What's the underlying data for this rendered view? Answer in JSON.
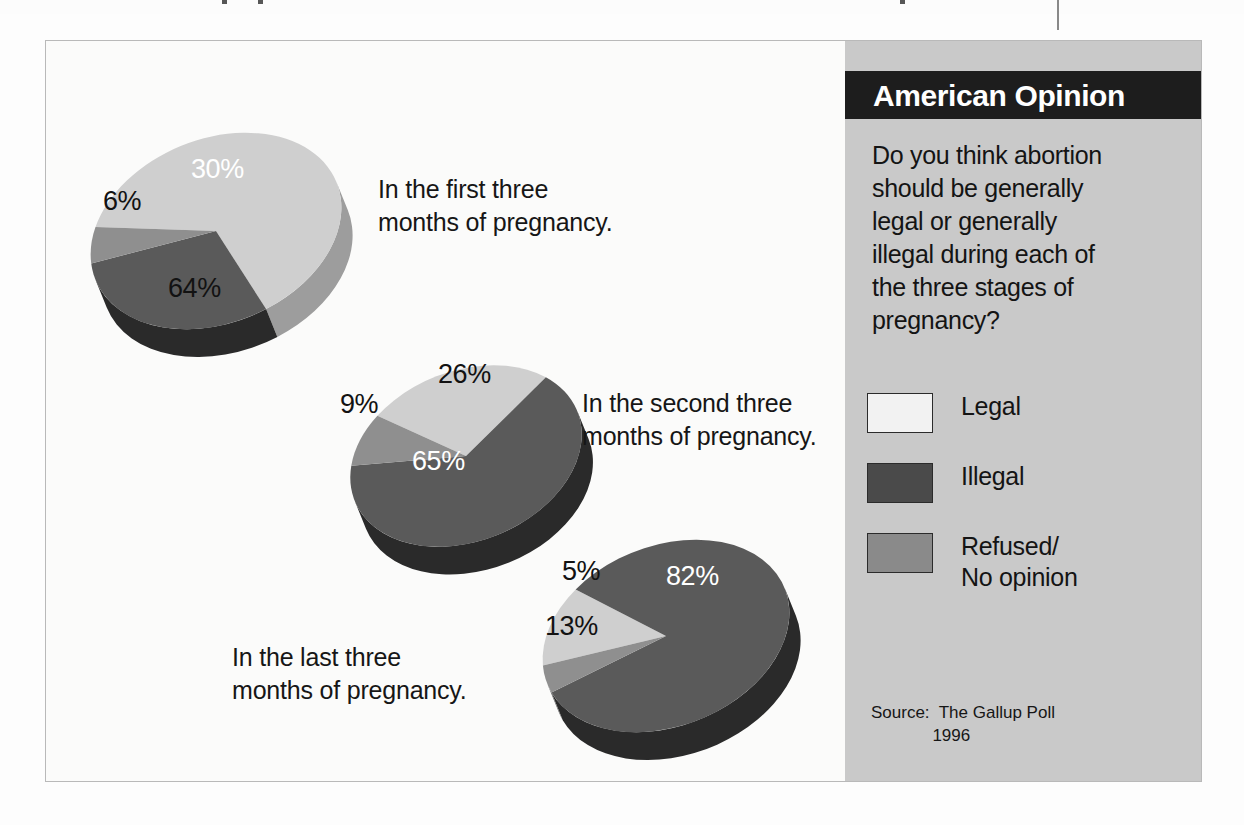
{
  "panel": {
    "title": "American Opinion",
    "question": "Do you think abortion\nshould be generally\nlegal or generally\nillegal during each of\nthe three stages of\npregnancy?",
    "source": "Source:  The Gallup Poll\n             1996",
    "legend": [
      {
        "label": "Legal",
        "color": "#f2f2f2"
      },
      {
        "label": "Illegal",
        "color": "#4a4a4a"
      },
      {
        "label": "Refused/\nNo opinion",
        "color": "#8a8a8a"
      }
    ]
  },
  "colors": {
    "panel_background": "#c9c9c9",
    "title_bar": "#1d1d1d",
    "frame_border": "#b9b9b9",
    "figure_background": "#fbfbfa",
    "legal_top": "#cfcfcf",
    "legal_side": "#9d9d9d",
    "illegal_top": "#5a5a5a",
    "illegal_side": "#2a2a2a",
    "refused_top": "#8f8f8f",
    "refused_side": "#6a6a6a",
    "label_dark": "#121212",
    "label_light": "#ffffff"
  },
  "chart_data": {
    "type": "pie",
    "title": "American Opinion",
    "subtitle": "Do you think abortion should be generally legal or generally illegal during each of the three stages of pregnancy?",
    "source": "The Gallup Poll 1996",
    "legend_position": "right",
    "units": "percent",
    "categories": [
      "Legal",
      "Illegal",
      "Refused/No opinion"
    ],
    "charts": [
      {
        "name": "first-trimester",
        "caption": "In the first three\nmonths of pregnancy.",
        "values": [
          64,
          30,
          6
        ],
        "labels": [
          "64%",
          "30%",
          "6%"
        ]
      },
      {
        "name": "second-trimester",
        "caption": "In the second three\nmonths of pregnancy.",
        "values": [
          26,
          65,
          9
        ],
        "labels": [
          "26%",
          "65%",
          "9%"
        ]
      },
      {
        "name": "third-trimester",
        "caption": "In the last three\nmonths of pregnancy.",
        "values": [
          13,
          82,
          5
        ],
        "labels": [
          "13%",
          "82%",
          "5%"
        ]
      }
    ]
  },
  "pie_geometry": [
    {
      "cx": 170,
      "cy": 190,
      "rx": 130,
      "ry": 92,
      "depth": 30,
      "rotate": -22,
      "start": 212,
      "slices": [
        {
          "key": "legal",
          "sweep": 230.4
        },
        {
          "key": "illegal",
          "sweep": 108.0
        },
        {
          "key": "refused",
          "sweep": 21.6
        }
      ],
      "caption": {
        "left": 332,
        "top": 132
      },
      "labels": [
        {
          "text": "64%",
          "left": 122,
          "top": 232,
          "dark": true
        },
        {
          "text": "30%",
          "left": 145,
          "top": 113,
          "dark": false
        },
        {
          "text": "6%",
          "left": 57,
          "top": 145,
          "dark": true
        }
      ]
    },
    {
      "cx": 420,
      "cy": 415,
      "rx": 120,
      "ry": 85,
      "depth": 30,
      "rotate": -22,
      "start": 236,
      "slices": [
        {
          "key": "legal",
          "sweep": 93.6
        },
        {
          "key": "illegal",
          "sweep": 234.0
        },
        {
          "key": "refused",
          "sweep": 32.4
        }
      ],
      "caption": {
        "left": 536,
        "top": 346
      },
      "labels": [
        {
          "text": "26%",
          "left": 392,
          "top": 318,
          "dark": true
        },
        {
          "text": "65%",
          "left": 366,
          "top": 405,
          "dark": false
        },
        {
          "text": "9%",
          "left": 294,
          "top": 348,
          "dark": true
        }
      ]
    },
    {
      "cx": 620,
      "cy": 595,
      "rx": 128,
      "ry": 90,
      "depth": 30,
      "rotate": -22,
      "start": 192,
      "slices": [
        {
          "key": "legal",
          "sweep": 46.8
        },
        {
          "key": "illegal",
          "sweep": 295.2
        },
        {
          "key": "refused",
          "sweep": 18.0
        }
      ],
      "caption": {
        "left": 186,
        "top": 600
      },
      "labels": [
        {
          "text": "13%",
          "left": 499,
          "top": 570,
          "dark": true
        },
        {
          "text": "82%",
          "left": 620,
          "top": 520,
          "dark": false
        },
        {
          "text": "5%",
          "left": 516,
          "top": 515,
          "dark": true
        }
      ]
    }
  ],
  "artifacts": {
    "top_ticks": [
      222,
      258,
      900
    ],
    "column_rule": true
  }
}
